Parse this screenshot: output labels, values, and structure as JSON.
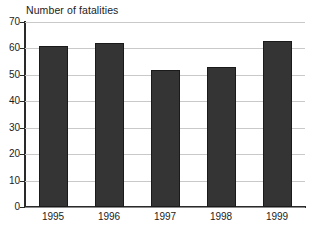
{
  "chart_data": {
    "type": "bar",
    "title": "Number of fatalities",
    "xlabel": "",
    "ylabel": "",
    "categories": [
      "1995",
      "1996",
      "1997",
      "1998",
      "1999"
    ],
    "values": [
      61,
      62,
      52,
      53,
      63
    ],
    "ylim": [
      0,
      70
    ],
    "yticks": [
      0,
      10,
      20,
      30,
      40,
      50,
      60,
      70
    ],
    "ytick_labels": [
      "0",
      "10",
      "20",
      "30",
      "40",
      "50",
      "60",
      "70"
    ],
    "grid": true,
    "legend": null,
    "series": [
      {
        "name": "Number of fatalities",
        "values": [
          61,
          62,
          52,
          53,
          63
        ]
      }
    ],
    "colors": {
      "bar_fill": "#343434",
      "bar_edge": "#1a1a1a",
      "gridline": "#c9c9c9",
      "axis": "#2a2a2a",
      "text": "#1c1c1c",
      "background": "#ffffff"
    }
  }
}
